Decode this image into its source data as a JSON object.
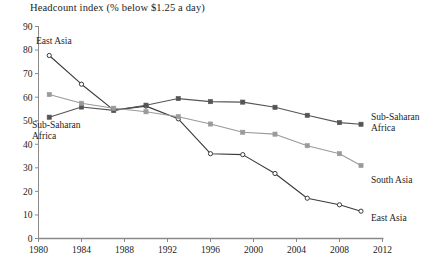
{
  "chart_data": {
    "type": "line",
    "title": "Headcount index (% below $1.25 a day)",
    "xlabel": "",
    "ylabel": "",
    "xlim": [
      1980,
      2012
    ],
    "ylim": [
      0,
      90
    ],
    "grid": false,
    "legend_position": "inline-right",
    "xticks": [
      1980,
      1984,
      1988,
      1992,
      1996,
      2000,
      2004,
      2008,
      2012
    ],
    "yticks": [
      0,
      10,
      20,
      30,
      40,
      50,
      60,
      70,
      80,
      90
    ],
    "series": [
      {
        "name": "East Asia",
        "marker": "open-circle",
        "color": "#3a3a3a",
        "x": [
          1981,
          1984,
          1987,
          1990,
          1993,
          1996,
          1999,
          2002,
          2005,
          2008,
          2010
        ],
        "values": [
          77.7,
          65.5,
          54.5,
          56.2,
          50.8,
          36.0,
          35.6,
          27.6,
          17.1,
          14.3,
          11.6
        ]
      },
      {
        "name": "Sub-Saharan Africa",
        "marker": "filled-square",
        "color": "#555555",
        "x": [
          1981,
          1984,
          1987,
          1990,
          1993,
          1996,
          1999,
          2002,
          2005,
          2008,
          2010
        ],
        "values": [
          51.5,
          55.8,
          54.4,
          56.6,
          59.4,
          58.1,
          57.9,
          55.7,
          52.3,
          49.2,
          48.5
        ]
      },
      {
        "name": "South Asia",
        "marker": "filled-square",
        "color": "#9a9a9a",
        "x": [
          1981,
          1984,
          1987,
          1990,
          1993,
          1996,
          1999,
          2002,
          2005,
          2008,
          2010
        ],
        "values": [
          61.1,
          57.4,
          55.3,
          53.8,
          51.7,
          48.6,
          45.1,
          44.3,
          39.4,
          36.0,
          31.0
        ]
      }
    ],
    "annotations": [
      {
        "text": "East Asia",
        "at": "top-left"
      },
      {
        "text": "Sub-Saharan",
        "at": "mid-left-line1"
      },
      {
        "text": "Africa",
        "at": "mid-left-line2"
      },
      {
        "text": "Sub-Saharan",
        "at": "right-line1"
      },
      {
        "text": "Africa",
        "at": "right-line2"
      },
      {
        "text": "South Asia",
        "at": "right-mid"
      },
      {
        "text": "East Asia",
        "at": "right-bottom"
      }
    ]
  },
  "labels": {
    "title": "Headcount index (% below $1.25 a day)",
    "east_asia_left": "East Asia",
    "ssa_left_line1": "Sub-Saharan",
    "ssa_left_line2": "Africa",
    "ssa_right_line1": "Sub-Saharan",
    "ssa_right_line2": "Africa",
    "south_asia_right": "South Asia",
    "east_asia_right": "East Asia"
  },
  "axes": {
    "y_ticks": [
      "0",
      "10",
      "20",
      "30",
      "40",
      "50",
      "60",
      "70",
      "80",
      "90"
    ],
    "x_ticks": [
      "1980",
      "1984",
      "1988",
      "1992",
      "1996",
      "2000",
      "2004",
      "2008",
      "2012"
    ]
  },
  "colors": {
    "axis": "#8a8a8a",
    "east_asia": "#3a3a3a",
    "sub_saharan_africa": "#555555",
    "south_asia": "#9a9a9a",
    "text": "#1c1c1c"
  }
}
